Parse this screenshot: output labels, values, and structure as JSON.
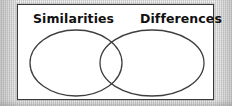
{
  "figure": {
    "type": "venn-diagram",
    "title": "",
    "background_color": "#cfcfcf",
    "panel_background_color": "#ffffff",
    "panel_border_color": "#3a3a3a",
    "stroke_color": "#3f3f3f",
    "text_color": "#111111",
    "circle_count": 2,
    "left_circle": {
      "label": "Similarities",
      "fill": "none"
    },
    "right_circle": {
      "label": "Differences",
      "fill": "none"
    },
    "overlap_label": ""
  },
  "labels": {
    "left": "Similarities",
    "right": "Differences"
  }
}
